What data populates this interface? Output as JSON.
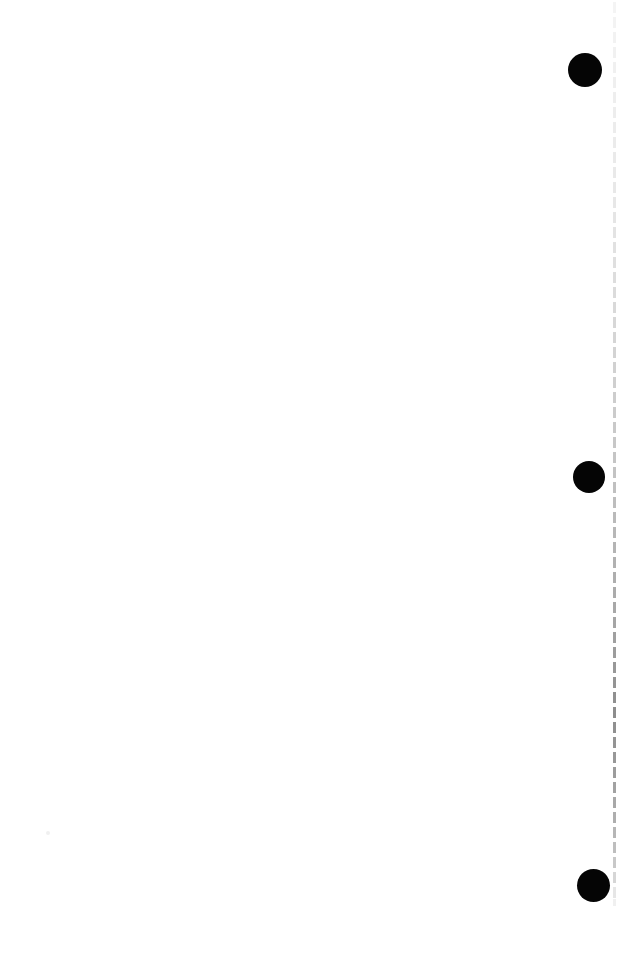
{
  "page": {
    "name": "scanned-page",
    "width": 621,
    "height": 959,
    "background_color": "#ffffff",
    "content_text": ""
  },
  "marks": {
    "color": "#000000",
    "label": "circular-mark",
    "items": [
      {
        "id": "mark-1",
        "x": 568,
        "y": 53,
        "size": 34,
        "color": "#050505"
      },
      {
        "id": "mark-2",
        "x": 573,
        "y": 461,
        "size": 32,
        "color": "#050505"
      },
      {
        "id": "mark-3",
        "x": 577,
        "y": 869,
        "size": 33,
        "color": "#050505"
      }
    ]
  },
  "margin_rule": {
    "label": "dashed-margin-rule",
    "x": 613,
    "top": 2,
    "bottom": 906,
    "width": 3,
    "dash_length": 11,
    "gap_length": 4,
    "color_top": "#f2f2f2",
    "color_bottom": "#8d8d8d",
    "segments": [
      {
        "y": 2,
        "h": 11,
        "color": "#f4f4f4"
      },
      {
        "y": 17,
        "h": 11,
        "color": "#f3f3f3"
      },
      {
        "y": 32,
        "h": 11,
        "color": "#f2f2f2"
      },
      {
        "y": 47,
        "h": 11,
        "color": "#f1f1f1"
      },
      {
        "y": 62,
        "h": 11,
        "color": "#f0f0f0"
      },
      {
        "y": 77,
        "h": 11,
        "color": "#efefef"
      },
      {
        "y": 92,
        "h": 11,
        "color": "#eeeeee"
      },
      {
        "y": 107,
        "h": 11,
        "color": "#ededed"
      },
      {
        "y": 122,
        "h": 11,
        "color": "#ececec"
      },
      {
        "y": 137,
        "h": 11,
        "color": "#ebebeb"
      },
      {
        "y": 152,
        "h": 11,
        "color": "#eaeaea"
      },
      {
        "y": 167,
        "h": 11,
        "color": "#e9e9e9"
      },
      {
        "y": 182,
        "h": 11,
        "color": "#e8e8e8"
      },
      {
        "y": 197,
        "h": 11,
        "color": "#e7e7e7"
      },
      {
        "y": 212,
        "h": 11,
        "color": "#e5e5e5"
      },
      {
        "y": 227,
        "h": 11,
        "color": "#e3e3e3"
      },
      {
        "y": 242,
        "h": 11,
        "color": "#e1e1e1"
      },
      {
        "y": 257,
        "h": 11,
        "color": "#dfdfdf"
      },
      {
        "y": 272,
        "h": 11,
        "color": "#dddddd"
      },
      {
        "y": 287,
        "h": 11,
        "color": "#dbdbdb"
      },
      {
        "y": 302,
        "h": 11,
        "color": "#d9d9d9"
      },
      {
        "y": 317,
        "h": 11,
        "color": "#d7d7d7"
      },
      {
        "y": 332,
        "h": 11,
        "color": "#d5d5d5"
      },
      {
        "y": 347,
        "h": 11,
        "color": "#d3d3d3"
      },
      {
        "y": 362,
        "h": 11,
        "color": "#d1d1d1"
      },
      {
        "y": 377,
        "h": 11,
        "color": "#cfcfcf"
      },
      {
        "y": 392,
        "h": 11,
        "color": "#cdcdcd"
      },
      {
        "y": 407,
        "h": 11,
        "color": "#cbcbcb"
      },
      {
        "y": 422,
        "h": 11,
        "color": "#c9c9c9"
      },
      {
        "y": 437,
        "h": 11,
        "color": "#c7c7c7"
      },
      {
        "y": 452,
        "h": 11,
        "color": "#c5c5c5"
      },
      {
        "y": 467,
        "h": 11,
        "color": "#c3c3c3"
      },
      {
        "y": 482,
        "h": 11,
        "color": "#c0c0c0"
      },
      {
        "y": 497,
        "h": 11,
        "color": "#bdbdbd"
      },
      {
        "y": 512,
        "h": 11,
        "color": "#bababa"
      },
      {
        "y": 527,
        "h": 11,
        "color": "#b7b7b7"
      },
      {
        "y": 542,
        "h": 11,
        "color": "#b4b4b4"
      },
      {
        "y": 557,
        "h": 11,
        "color": "#b1b1b1"
      },
      {
        "y": 572,
        "h": 11,
        "color": "#aeaeae"
      },
      {
        "y": 587,
        "h": 11,
        "color": "#ababab"
      },
      {
        "y": 602,
        "h": 11,
        "color": "#a8a8a8"
      },
      {
        "y": 617,
        "h": 11,
        "color": "#a5a5a5"
      },
      {
        "y": 632,
        "h": 11,
        "color": "#a0a0a0"
      },
      {
        "y": 647,
        "h": 11,
        "color": "#9c9c9c"
      },
      {
        "y": 662,
        "h": 11,
        "color": "#989898"
      },
      {
        "y": 677,
        "h": 11,
        "color": "#949494"
      },
      {
        "y": 692,
        "h": 11,
        "color": "#909090"
      },
      {
        "y": 707,
        "h": 11,
        "color": "#8d8d8d"
      },
      {
        "y": 722,
        "h": 11,
        "color": "#909090"
      },
      {
        "y": 737,
        "h": 11,
        "color": "#949494"
      },
      {
        "y": 752,
        "h": 11,
        "color": "#989898"
      },
      {
        "y": 767,
        "h": 11,
        "color": "#9c9c9c"
      },
      {
        "y": 782,
        "h": 11,
        "color": "#a2a2a2"
      },
      {
        "y": 797,
        "h": 11,
        "color": "#a8a8a8"
      },
      {
        "y": 812,
        "h": 11,
        "color": "#aeaeae"
      },
      {
        "y": 827,
        "h": 11,
        "color": "#b6b6b6"
      },
      {
        "y": 842,
        "h": 11,
        "color": "#bebebe"
      },
      {
        "y": 857,
        "h": 11,
        "color": "#c8c8c8"
      },
      {
        "y": 872,
        "h": 11,
        "color": "#d6d6d6"
      },
      {
        "y": 887,
        "h": 11,
        "color": "#e6e6e6"
      },
      {
        "y": 899,
        "h": 7,
        "color": "#f0f0f0"
      }
    ]
  },
  "speck": {
    "label": "scan-speck",
    "x": 46,
    "y": 831,
    "size": 4,
    "color": "#f0f0f0"
  }
}
